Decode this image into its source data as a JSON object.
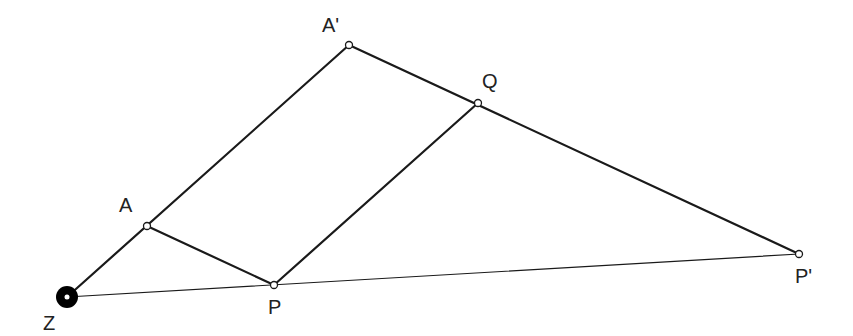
{
  "diagram": {
    "type": "geometric-construction",
    "points": {
      "Z": {
        "label": "Z",
        "x": 67,
        "y": 297,
        "style": "center",
        "label_x": 43,
        "label_y": 330
      },
      "A": {
        "label": "A",
        "x": 147,
        "y": 226,
        "style": "open",
        "label_x": 119,
        "label_y": 212
      },
      "A'": {
        "label": "A'",
        "x": 349,
        "y": 45,
        "style": "open",
        "label_x": 322,
        "label_y": 32
      },
      "Q": {
        "label": "Q",
        "x": 478,
        "y": 103,
        "style": "open",
        "label_x": 482,
        "label_y": 88
      },
      "P": {
        "label": "P",
        "x": 274,
        "y": 285,
        "style": "open",
        "label_x": 268,
        "label_y": 314
      },
      "P'": {
        "label": "P'",
        "x": 799,
        "y": 254,
        "style": "open",
        "label_x": 795,
        "label_y": 283
      }
    },
    "segments": [
      {
        "from": "Z",
        "to": "A'",
        "weight": "thick"
      },
      {
        "from": "A",
        "to": "P",
        "weight": "thick"
      },
      {
        "from": "A'",
        "to": "P'",
        "weight": "thick"
      },
      {
        "from": "P",
        "to": "Q",
        "weight": "thick"
      },
      {
        "from": "Z",
        "to": "P'",
        "weight": "thin"
      }
    ],
    "colors": {
      "line": "#1a1a1a",
      "point_fill": "#ffffff",
      "label": "#222222"
    }
  }
}
